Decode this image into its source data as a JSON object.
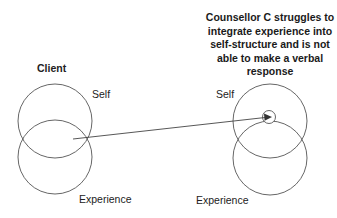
{
  "diagram": {
    "left_group": {
      "title": "Client",
      "self_label": "Self",
      "experience_label": "Experience"
    },
    "right_group": {
      "caption_lines": [
        "Counsellor C struggles to",
        "integrate experience into",
        "self-structure and is not",
        "able to make a verbal",
        "response"
      ],
      "self_label": "Self",
      "experience_label": "Experience"
    },
    "arrow": {
      "from": "client-overlap",
      "to": "counsellor-self-small-circle"
    },
    "colors": {
      "stroke": "#555555",
      "text": "#222222",
      "background": "#ffffff"
    }
  }
}
